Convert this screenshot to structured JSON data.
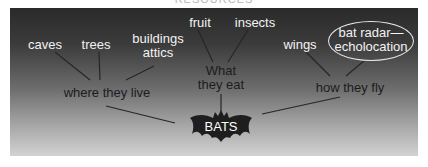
{
  "header": {
    "cutoff_text": "RESOURCES"
  },
  "diagram": {
    "center": {
      "label": "BATS"
    },
    "branches": [
      {
        "label": "where they live",
        "children": [
          "caves",
          "trees",
          "buildings attics"
        ]
      },
      {
        "label_line1": "What",
        "label_line2": "they eat",
        "children": [
          "fruit",
          "insects"
        ]
      },
      {
        "label": "how they fly",
        "children": [
          "wings",
          "bat radar—echolocation"
        ]
      }
    ],
    "nodes": {
      "caves": "caves",
      "trees": "trees",
      "buildings_line1": "buildings",
      "buildings_line2": "attics",
      "fruit": "fruit",
      "insects": "insects",
      "what_line1": "What",
      "what_line2": "they eat",
      "where": "where they live",
      "wings": "wings",
      "radar_line1": "bat radar—",
      "radar_line2": "echolocation",
      "how": "how they fly",
      "center": "BATS"
    },
    "colors": {
      "panel_top": "#2a2a2a",
      "panel_bottom": "#d2d2d2",
      "light_text": "#f2f2f2",
      "dark_text": "#1c1c1c",
      "bat_fill": "#1e1e1e"
    }
  }
}
